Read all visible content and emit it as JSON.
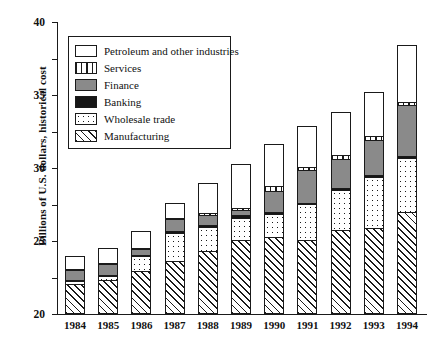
{
  "chart_data": {
    "type": "bar",
    "subtype": "stacked-bar",
    "title": "",
    "xlabel": "",
    "ylabel": "Billions of U.S. dollars, historical cost",
    "ylim": [
      0,
      40
    ],
    "yticks": [
      0,
      5,
      10,
      15,
      20,
      25,
      30,
      35,
      40
    ],
    "ytick_labels": [
      "0",
      "5",
      "10",
      "15",
      "20",
      "25",
      "30",
      "35",
      "40"
    ],
    "grid": false,
    "legend_position": "upper-left-inside",
    "categories": [
      "1984",
      "1985",
      "1986",
      "1987",
      "1988",
      "1989",
      "1990",
      "1991",
      "1992",
      "1993",
      "1994"
    ],
    "series": [
      {
        "name": "Manufacturing",
        "pattern": "diagonal-hatch",
        "values": [
          4.1,
          4.7,
          5.9,
          7.3,
          8.6,
          10.1,
          10.5,
          10.2,
          11.5,
          11.8,
          14.0
        ]
      },
      {
        "name": "Wholesale trade",
        "pattern": "dotted",
        "values": [
          0.6,
          0.6,
          2.2,
          4.0,
          3.4,
          3.2,
          3.4,
          5.0,
          5.6,
          7.1,
          7.5
        ]
      },
      {
        "name": "Banking",
        "pattern": "solid-black",
        "values": [
          0.3,
          0.3,
          0.3,
          0.4,
          0.5,
          0.5,
          0.3,
          0.3,
          0.4,
          0.4,
          0.4
        ]
      },
      {
        "name": "Finance",
        "pattern": "solid-gray",
        "values": [
          1.4,
          1.7,
          0.9,
          1.7,
          1.5,
          0.9,
          3.1,
          4.6,
          4.1,
          5.0,
          7.1
        ]
      },
      {
        "name": "Services",
        "pattern": "vertical-stripe",
        "values": [
          0.2,
          0.2,
          0.2,
          0.3,
          0.4,
          0.4,
          0.8,
          0.6,
          0.7,
          0.6,
          0.6
        ]
      },
      {
        "name": "Petroleum and other industries",
        "pattern": "white",
        "values": [
          1.9,
          2.2,
          2.5,
          2.2,
          4.3,
          6.2,
          5.9,
          5.7,
          6.0,
          6.2,
          7.9
        ]
      }
    ],
    "totals": [
      8.5,
      9.7,
      12.0,
      15.9,
      18.7,
      21.3,
      24.0,
      26.4,
      28.3,
      31.1,
      37.5
    ]
  },
  "legend": {
    "items": [
      {
        "label": "Petroleum and other industries",
        "swatch": "white"
      },
      {
        "label": "Services",
        "swatch": "vertical-stripe"
      },
      {
        "label": "Finance",
        "swatch": "solid-gray"
      },
      {
        "label": "Banking",
        "swatch": "solid-black"
      },
      {
        "label": "Wholesale trade",
        "swatch": "dotted"
      },
      {
        "label": "Manufacturing",
        "swatch": "diagonal-hatch"
      }
    ]
  },
  "colors": {
    "axis": "#1a1a1a",
    "finance": "#8a8a8a",
    "banking": "#161616",
    "background": "#ffffff"
  }
}
